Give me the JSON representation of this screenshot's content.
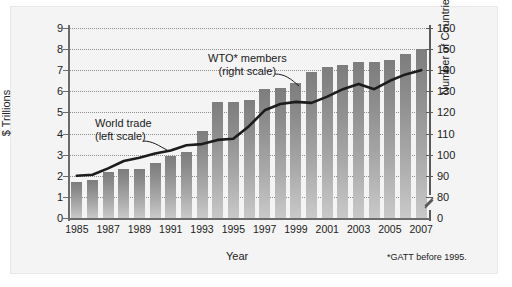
{
  "chart_data": {
    "type": "bar",
    "title": "",
    "xlabel": "Year",
    "ylabel": "$ Trillions",
    "y2label": "Number of Countries",
    "grid": true,
    "legend_position": "inline-annotations",
    "ylim": [
      0,
      9
    ],
    "y2lim": [
      70,
      160
    ],
    "y2_axis_break": true,
    "yticks": [
      0,
      1,
      2,
      3,
      4,
      5,
      6,
      7,
      8,
      9
    ],
    "y2ticks": [
      0,
      80,
      90,
      100,
      110,
      120,
      130,
      140,
      150,
      160
    ],
    "x": [
      1985,
      1986,
      1987,
      1988,
      1989,
      1990,
      1991,
      1992,
      1993,
      1994,
      1995,
      1996,
      1997,
      1998,
      1999,
      2000,
      2001,
      2002,
      2003,
      2004,
      2005,
      2006,
      2007
    ],
    "categories": [
      "1985",
      "1986",
      "1987",
      "1988",
      "1989",
      "1990",
      "1991",
      "1992",
      "1993",
      "1994",
      "1995",
      "1996",
      "1997",
      "1998",
      "1999",
      "2000",
      "2001",
      "2002",
      "2003",
      "2004",
      "2005",
      "2006",
      "2007"
    ],
    "xticklabels": [
      "1985",
      "",
      "1987",
      "",
      "1989",
      "",
      "1991",
      "",
      "1993",
      "",
      "1995",
      "",
      "1997",
      "",
      "1999",
      "",
      "2001",
      "",
      "2003",
      "",
      "2005",
      "",
      "2007"
    ],
    "series": [
      {
        "name": "WTO* members (right scale)",
        "type": "bar",
        "axis": "right",
        "unit": "countries",
        "values": [
          90,
          91,
          92,
          93,
          93,
          96,
          99,
          101,
          111,
          125,
          125,
          126,
          131,
          132,
          134,
          139,
          142,
          143,
          145,
          145,
          146,
          150,
          151
        ],
        "values_left_scale_equivalent": [
          1.7,
          1.8,
          2.2,
          2.3,
          2.3,
          2.6,
          2.95,
          3.15,
          4.1,
          5.5,
          5.5,
          5.6,
          6.1,
          6.15,
          6.4,
          6.9,
          7.15,
          7.25,
          7.4,
          7.4,
          7.5,
          7.75,
          8.0
        ]
      },
      {
        "name": "World trade (left scale)",
        "type": "line",
        "axis": "left",
        "unit": "$ Trillions",
        "values": [
          2.0,
          2.05,
          2.35,
          2.7,
          2.85,
          3.05,
          3.2,
          3.45,
          3.5,
          3.7,
          3.75,
          4.35,
          5.1,
          5.4,
          5.5,
          5.45,
          5.75,
          6.1,
          6.35,
          6.1,
          6.5,
          6.8,
          7.0
        ]
      }
    ],
    "annotations": [
      {
        "id": "wto-annot",
        "line1": "WTO* members",
        "line2": "(right scale)"
      },
      {
        "id": "trade-annot",
        "line1": "World trade",
        "line2": "(left scale)"
      }
    ],
    "footnote": "*GATT before 1995."
  },
  "axes": {
    "left": {
      "title": "$ Trillions",
      "ticklabels": [
        "9",
        "8",
        "7",
        "6",
        "5",
        "4",
        "3",
        "2",
        "1",
        "0"
      ]
    },
    "right": {
      "title": "Number of Countries",
      "ticklabels": [
        "160",
        "150",
        "140",
        "130",
        "120",
        "110",
        "100",
        "90",
        "80",
        "0"
      ]
    },
    "bottom": {
      "title": "Year",
      "ticklabels": [
        "1985",
        "1987",
        "1989",
        "1991",
        "1993",
        "1995",
        "1997",
        "1999",
        "2001",
        "2003",
        "2005",
        "2007"
      ]
    }
  },
  "style": {
    "bar_color_top": "#7d7d7d",
    "bar_color_bottom": "#c9c9c9",
    "line_color": "#1c1c1c",
    "grid_color": "#8f8f8f",
    "axis_color": "#6b6b6b",
    "panel_background": "#f4f4f4",
    "page_background": "#ffffff"
  }
}
